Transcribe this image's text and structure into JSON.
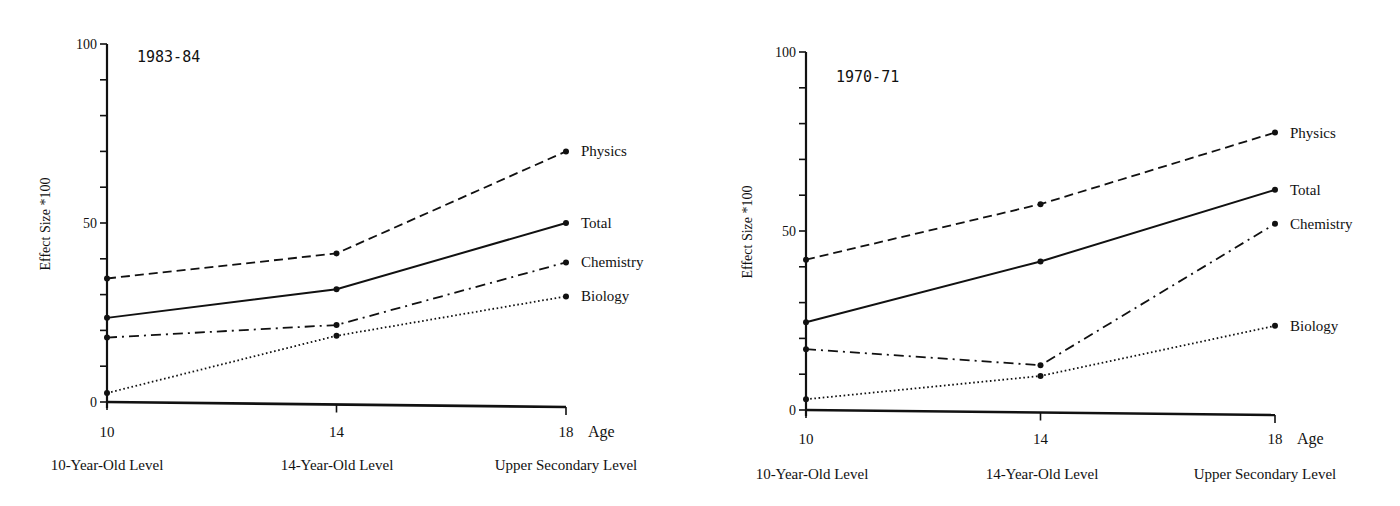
{
  "chart_data": [
    {
      "type": "line",
      "title": "1983-84",
      "xlabel": "Age",
      "ylabel": "Effect Size *100",
      "x": [
        10,
        14,
        18
      ],
      "x_tick_labels": [
        "10",
        "14",
        "18"
      ],
      "x_level_labels": [
        "10-Year-Old Level",
        "14-Year-Old Level",
        "Upper Secondary Level"
      ],
      "y_tick_labels": [
        "0",
        "50",
        "100"
      ],
      "ylim": [
        0,
        100
      ],
      "y_minor_step": 10,
      "grid": false,
      "legend_position": "inline-right",
      "series": [
        {
          "name": "Physics",
          "style": "dashed",
          "values": [
            34.5,
            41.5,
            70
          ]
        },
        {
          "name": "Total",
          "style": "solid",
          "values": [
            23.5,
            31.5,
            50
          ]
        },
        {
          "name": "Chemistry",
          "style": "dash-dot",
          "values": [
            18,
            21.5,
            39
          ]
        },
        {
          "name": "Biology",
          "style": "dotted",
          "values": [
            2.5,
            18.5,
            29.5
          ]
        }
      ]
    },
    {
      "type": "line",
      "title": "1970-71",
      "xlabel": "Age",
      "ylabel": "Effect Size *100",
      "x": [
        10,
        14,
        18
      ],
      "x_tick_labels": [
        "10",
        "14",
        "18"
      ],
      "x_level_labels": [
        "10-Year-Old Level",
        "14-Year-Old Level",
        "Upper Secondary Level"
      ],
      "y_tick_labels": [
        "0",
        "50",
        "100"
      ],
      "ylim": [
        0,
        100
      ],
      "y_minor_step": 10,
      "grid": false,
      "legend_position": "inline-right",
      "series": [
        {
          "name": "Physics",
          "style": "dashed",
          "values": [
            42,
            57.5,
            77.5
          ]
        },
        {
          "name": "Total",
          "style": "solid",
          "values": [
            24.5,
            41.5,
            61.5
          ]
        },
        {
          "name": "Chemistry",
          "style": "dash-dot",
          "values": [
            17,
            12.5,
            52
          ]
        },
        {
          "name": "Biology",
          "style": "dotted",
          "values": [
            3,
            9.5,
            23.5
          ]
        }
      ]
    }
  ],
  "layout": [
    {
      "left": 0,
      "x0": 107,
      "x18": 566,
      "y0": 402,
      "y100": 44,
      "title_x": 137,
      "title_y": 62,
      "ylabel_x": 50,
      "ylabel_y": 224,
      "tick_y": 437,
      "level_y": 470,
      "level_xs": [
        107,
        337,
        566
      ],
      "age_dx": 22
    },
    {
      "left": 0,
      "x0": 806,
      "x18": 1275,
      "y0": 410,
      "y100": 52,
      "title_x": 836,
      "title_y": 82,
      "ylabel_x": 752,
      "ylabel_y": 232,
      "tick_y": 444,
      "level_y": 479,
      "level_xs": [
        812,
        1042,
        1265
      ],
      "age_dx": 22
    }
  ]
}
